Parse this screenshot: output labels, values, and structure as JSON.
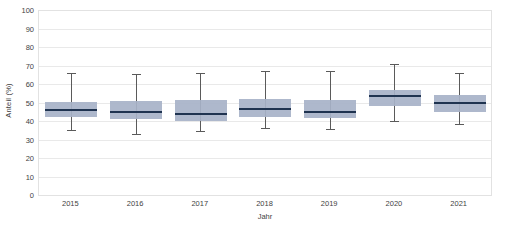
{
  "chart_data": {
    "type": "box",
    "title": "",
    "xlabel": "Jahr",
    "ylabel": "Anteil  (%)",
    "categories": [
      "2015",
      "2016",
      "2017",
      "2018",
      "2019",
      "2020",
      "2021"
    ],
    "ylim": [
      0,
      100
    ],
    "yticks": [
      0,
      10,
      20,
      30,
      40,
      50,
      60,
      70,
      80,
      90,
      100
    ],
    "ytick_labels": [
      "0",
      "10",
      "20",
      "30",
      "40",
      "50",
      "60",
      "70",
      "80",
      "90",
      "100"
    ],
    "grid": true,
    "legend": false,
    "boxes": [
      {
        "category": "2015",
        "whisker_low": 35.0,
        "q1": 42.0,
        "median": 46.0,
        "q3": 50.5,
        "whisker_high": 66.0
      },
      {
        "category": "2016",
        "whisker_low": 33.0,
        "q1": 41.0,
        "median": 45.0,
        "q3": 51.0,
        "whisker_high": 65.5
      },
      {
        "category": "2017",
        "whisker_low": 34.5,
        "q1": 40.0,
        "median": 44.0,
        "q3": 51.5,
        "whisker_high": 66.0
      },
      {
        "category": "2018",
        "whisker_low": 36.0,
        "q1": 42.0,
        "median": 46.5,
        "q3": 52.0,
        "whisker_high": 67.0
      },
      {
        "category": "2019",
        "whisker_low": 35.5,
        "q1": 41.5,
        "median": 45.0,
        "q3": 51.5,
        "whisker_high": 67.0
      },
      {
        "category": "2020",
        "whisker_low": 40.0,
        "q1": 48.0,
        "median": 53.5,
        "q3": 57.0,
        "whisker_high": 71.0
      },
      {
        "category": "2021",
        "whisker_low": 38.5,
        "q1": 45.0,
        "median": 50.0,
        "q3": 54.0,
        "whisker_high": 66.0
      }
    ],
    "colors": {
      "box_fill": "#a7b2c8",
      "median": "#1f3350",
      "whisker": "#5a5a5a",
      "gridline": "#e9e9e9",
      "axis": "#c9c9c9",
      "background": "#ffffff",
      "text": "#3f3f3f"
    }
  }
}
